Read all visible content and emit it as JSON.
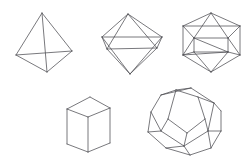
{
  "figure": {
    "background_color": "#ffffff",
    "line_color": "#4c4c52",
    "line_width": 0.75,
    "canvas": {
      "width": 249,
      "height": 160
    },
    "solids": [
      {
        "name": "tetrahedron",
        "label": "Tetrahedron",
        "faces": 4,
        "face_shape": "triangle",
        "row": 1,
        "column": 1,
        "vertices": [
          [
            42,
            13
          ],
          [
            16,
            55
          ],
          [
            72,
            51
          ],
          [
            47,
            72
          ]
        ],
        "silhouette": [
          0,
          1,
          3,
          2
        ],
        "edges": [
          [
            0,
            1
          ],
          [
            0,
            2
          ],
          [
            0,
            3
          ],
          [
            1,
            2
          ],
          [
            1,
            3
          ],
          [
            2,
            3
          ]
        ],
        "hidden_edges": [
          [
            1,
            2
          ]
        ]
      },
      {
        "name": "octahedron",
        "label": "Octahedron",
        "faces": 8,
        "face_shape": "triangle",
        "row": 1,
        "column": 2,
        "vertices": [
          [
            128,
            14
          ],
          [
            102,
            37
          ],
          [
            107,
            49
          ],
          [
            157,
            48
          ],
          [
            162,
            37
          ],
          [
            130,
            74
          ]
        ],
        "silhouette": [
          0,
          1,
          2,
          5,
          3,
          4
        ],
        "edges": [
          [
            0,
            1
          ],
          [
            0,
            2
          ],
          [
            0,
            3
          ],
          [
            0,
            4
          ],
          [
            1,
            2
          ],
          [
            1,
            4
          ],
          [
            2,
            3
          ],
          [
            2,
            5
          ],
          [
            3,
            4
          ],
          [
            3,
            5
          ],
          [
            1,
            5
          ],
          [
            4,
            5
          ]
        ],
        "hidden_edges": [
          [
            1,
            4
          ]
        ]
      },
      {
        "name": "icosahedron",
        "label": "Icosahedron",
        "faces": 20,
        "face_shape": "triangle",
        "row": 1,
        "column": 3,
        "vertices": [
          [
            211,
            13
          ],
          [
            183,
            26
          ],
          [
            240,
            26
          ],
          [
            183,
            55
          ],
          [
            240,
            55
          ],
          [
            211,
            72
          ],
          [
            194,
            38
          ],
          [
            228,
            38
          ],
          [
            194,
            52
          ],
          [
            228,
            52
          ]
        ],
        "silhouette": [
          0,
          1,
          3,
          5,
          4,
          2
        ],
        "edges": [
          [
            0,
            1
          ],
          [
            0,
            2
          ],
          [
            1,
            2
          ],
          [
            1,
            3
          ],
          [
            2,
            4
          ],
          [
            3,
            5
          ],
          [
            4,
            5
          ],
          [
            0,
            6
          ],
          [
            0,
            7
          ],
          [
            6,
            7
          ],
          [
            1,
            6
          ],
          [
            2,
            7
          ],
          [
            3,
            6
          ],
          [
            4,
            7
          ],
          [
            6,
            8
          ],
          [
            7,
            9
          ],
          [
            8,
            9
          ],
          [
            3,
            8
          ],
          [
            4,
            9
          ],
          [
            5,
            8
          ],
          [
            5,
            9
          ],
          [
            3,
            9
          ],
          [
            6,
            9
          ]
        ]
      },
      {
        "name": "cube",
        "label": "Cube",
        "faces": 6,
        "face_shape": "square",
        "row": 2,
        "column": 1,
        "vertices": [
          [
            90,
            97
          ],
          [
            110,
            108
          ],
          [
            88,
            117
          ],
          [
            67,
            109
          ],
          [
            110,
            143
          ],
          [
            88,
            152
          ],
          [
            67,
            144
          ]
        ],
        "silhouette": [
          0,
          1,
          4,
          5,
          6,
          3
        ],
        "edges": [
          [
            0,
            1
          ],
          [
            1,
            2
          ],
          [
            2,
            3
          ],
          [
            3,
            0
          ],
          [
            1,
            4
          ],
          [
            2,
            5
          ],
          [
            3,
            6
          ],
          [
            4,
            5
          ],
          [
            5,
            6
          ]
        ]
      },
      {
        "name": "dodecahedron",
        "label": "Dodecahedron",
        "faces": 12,
        "face_shape": "pentagon",
        "row": 2,
        "column": 2,
        "vertices": [
          [
            176,
            90
          ],
          [
            198,
            97
          ],
          [
            205,
            119
          ],
          [
            187,
            133
          ],
          [
            168,
            119
          ],
          [
            161,
            95
          ],
          [
            191,
            88
          ],
          [
            214,
            103
          ],
          [
            208,
            131
          ],
          [
            184,
            146
          ],
          [
            161,
            131
          ],
          [
            151,
            112
          ],
          [
            148,
            132
          ],
          [
            166,
            148
          ],
          [
            190,
            155
          ],
          [
            211,
            148
          ],
          [
            221,
            131
          ],
          [
            221,
            111
          ]
        ],
        "silhouette": [
          5,
          6,
          7,
          17,
          16,
          15,
          14,
          13,
          12,
          11
        ],
        "edges": [
          [
            0,
            1
          ],
          [
            1,
            2
          ],
          [
            2,
            3
          ],
          [
            3,
            4
          ],
          [
            4,
            0
          ],
          [
            0,
            6
          ],
          [
            1,
            7
          ],
          [
            2,
            8
          ],
          [
            3,
            9
          ],
          [
            4,
            10
          ],
          [
            5,
            6
          ],
          [
            6,
            7
          ],
          [
            7,
            17
          ],
          [
            17,
            16
          ],
          [
            16,
            15
          ],
          [
            15,
            14
          ],
          [
            14,
            13
          ],
          [
            13,
            12
          ],
          [
            12,
            11
          ],
          [
            11,
            5
          ],
          [
            5,
            0
          ],
          [
            8,
            16
          ],
          [
            8,
            15
          ],
          [
            9,
            14
          ],
          [
            9,
            13
          ],
          [
            10,
            12
          ],
          [
            10,
            11
          ],
          [
            7,
            8
          ],
          [
            8,
            9
          ],
          [
            9,
            10
          ]
        ]
      }
    ]
  }
}
